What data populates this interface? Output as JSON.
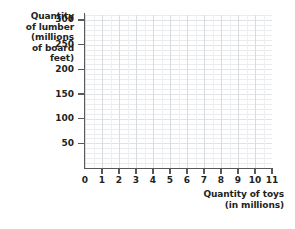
{
  "chart_data": {
    "type": "scatter",
    "title": "",
    "xlabel": "Quantity of toys (in millions)",
    "ylabel": "Quantity of lumber (millions of board feet)",
    "xlabel_lines": [
      "Quantity of toys",
      "(in millions)"
    ],
    "ylabel_lines": [
      "Quantity of lumber",
      "(millions",
      "of board",
      "feet)"
    ],
    "ylabel_line_1": "Quantity",
    "ylabel_line_2": "of lumber",
    "ylabel_line_3": "(millions",
    "ylabel_line_4": "of board",
    "ylabel_line_5": "feet)",
    "xlabel_line_1": "Quantity of toys",
    "xlabel_line_2": "(in millions)",
    "x": [],
    "y": [],
    "series": [],
    "xlim": [
      0,
      11
    ],
    "ylim": [
      0,
      310
    ],
    "xticks": [
      0,
      1,
      2,
      3,
      4,
      5,
      6,
      7,
      8,
      9,
      10,
      11
    ],
    "xticklabels": [
      "0",
      "1",
      "2",
      "3",
      "4",
      "5",
      "6",
      "7",
      "8",
      "9",
      "10",
      "11"
    ],
    "yticks": [
      50,
      100,
      150,
      200,
      250,
      300
    ],
    "yticklabels": [
      "50",
      "100",
      "150",
      "200",
      "250",
      "300"
    ],
    "y_minor_step": 10,
    "x_minor_step": 0.5,
    "grid": true,
    "grid_minor": true,
    "legend": null,
    "annotations": [],
    "colors": {
      "background": "#ffffff",
      "axis": "#58595b",
      "text": "#231f20",
      "gridline_minor": "#e9ebee",
      "gridline_major": "#dfe2e6"
    }
  }
}
